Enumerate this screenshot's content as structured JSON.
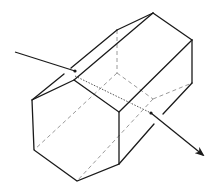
{
  "diagram": {
    "type": "hexagonal-prism-light-ray",
    "colors": {
      "edge": "#1a1a1a",
      "hidden_edge": "#9a9a9a",
      "ray": "#1a1a1a",
      "background": "#ffffff"
    },
    "front_face": [
      [
        74,
        80
      ],
      [
        32,
        100
      ],
      [
        34,
        150
      ],
      [
        77,
        181
      ],
      [
        119,
        164
      ],
      [
        119,
        112
      ]
    ],
    "back_face_visible": [
      [
        117,
        30
      ],
      [
        153,
        13
      ],
      [
        192,
        40
      ],
      [
        192,
        83
      ]
    ],
    "back_face_hidden_vertices": [
      [
        117,
        73
      ],
      [
        153,
        99
      ]
    ],
    "visible_edges": [
      [
        [
          32,
          100
        ],
        [
          64,
          74
        ]
      ],
      [
        [
          71,
          68
        ],
        [
          117,
          30
        ]
      ],
      [
        [
          117,
          30
        ],
        [
          153,
          13
        ]
      ],
      [
        [
          74,
          80
        ],
        [
          153,
          13
        ]
      ],
      [
        [
          153,
          13
        ],
        [
          192,
          40
        ]
      ],
      [
        [
          192,
          40
        ],
        [
          192,
          83
        ]
      ],
      [
        [
          119,
          112
        ],
        [
          192,
          40
        ]
      ],
      [
        [
          192,
          83
        ],
        [
          163,
          114
        ]
      ],
      [
        [
          154,
          124
        ],
        [
          119,
          164
        ]
      ]
    ],
    "hidden_edges": [
      [
        [
          117,
          30
        ],
        [
          117,
          73
        ]
      ],
      [
        [
          117,
          73
        ],
        [
          153,
          99
        ]
      ],
      [
        [
          153,
          99
        ],
        [
          192,
          83
        ]
      ],
      [
        [
          117,
          73
        ],
        [
          34,
          150
        ]
      ],
      [
        [
          153,
          99
        ],
        [
          77,
          181
        ]
      ]
    ],
    "incident_ray": {
      "from": [
        15,
        52
      ],
      "to": [
        75,
        71
      ]
    },
    "internal_ray": {
      "from": [
        75,
        76
      ],
      "to": [
        151,
        113
      ]
    },
    "exit_ray": {
      "from": [
        151,
        113
      ],
      "to": [
        203,
        155
      ]
    }
  }
}
